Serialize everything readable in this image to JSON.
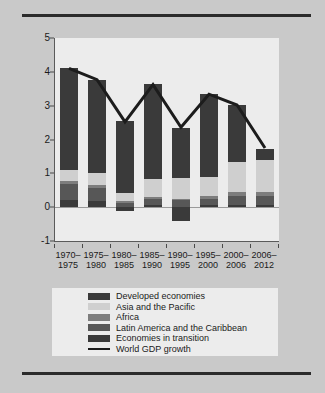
{
  "chart_data": {
    "type": "bar",
    "title": "",
    "subtitle": "",
    "xlabel": "",
    "ylabel": "",
    "stacked": true,
    "grid": false,
    "legend_position": "bottom",
    "ylim": [
      -1,
      5
    ],
    "yticks": [
      -1,
      0,
      1,
      2,
      3,
      4,
      5
    ],
    "ytick_labels": [
      "-1",
      "0",
      "1",
      "2",
      "3",
      "4",
      "5"
    ],
    "categories": [
      "1970–1975",
      "1975–1980",
      "1980–1985",
      "1985–1990",
      "1990–1995",
      "1995–2000",
      "2000–2006",
      "2006–2012"
    ],
    "category_lines": [
      [
        "1970–",
        "1975"
      ],
      [
        "1975–",
        "1980"
      ],
      [
        "1980–",
        "1985"
      ],
      [
        "1985–",
        "1990"
      ],
      [
        "1990–",
        "1995"
      ],
      [
        "1995–",
        "2000"
      ],
      [
        "2000–",
        "2006"
      ],
      [
        "2006–",
        "2012"
      ]
    ],
    "series": [
      {
        "name": "Economies in transition",
        "color": "#3a3a3a",
        "values": [
          0.22,
          0.18,
          -0.12,
          0.06,
          -0.42,
          0.05,
          0.06,
          0.05
        ]
      },
      {
        "name": "Latin America and the Caribbean",
        "color": "#575757",
        "values": [
          0.45,
          0.4,
          0.12,
          0.18,
          0.2,
          0.2,
          0.26,
          0.28
        ]
      },
      {
        "name": "Africa",
        "color": "#7d7d7d",
        "values": [
          0.11,
          0.08,
          0.06,
          0.06,
          0.05,
          0.07,
          0.12,
          0.12
        ]
      },
      {
        "name": "Asia and the Pacific",
        "color": "#cfcfcf",
        "values": [
          0.33,
          0.35,
          0.25,
          0.52,
          0.62,
          0.57,
          0.9,
          0.95
        ]
      },
      {
        "name": "Developed economies",
        "color": "#3a3a3a",
        "values": [
          2.99,
          2.76,
          2.12,
          2.81,
          1.47,
          2.45,
          1.67,
          0.32
        ]
      }
    ],
    "line_series": {
      "name": "World GDP growth",
      "color": "#1c1c1c",
      "values": [
        4.1,
        3.77,
        2.52,
        3.62,
        2.36,
        3.34,
        3.02,
        1.75
      ]
    }
  },
  "legend": {
    "entries": [
      {
        "label": "Developed economies",
        "swatch": "#3a3a3a",
        "type": "box"
      },
      {
        "label": "Asia and the Pacific",
        "swatch": "#cfcfcf",
        "type": "box"
      },
      {
        "label": "Africa",
        "swatch": "#7d7d7d",
        "type": "box"
      },
      {
        "label": "Latin America and the Caribbean",
        "swatch": "#575757",
        "type": "box"
      },
      {
        "label": "Economies in transition",
        "swatch": "#3a3a3a",
        "type": "box"
      },
      {
        "label": "World GDP growth",
        "swatch": "#1c1c1c",
        "type": "line"
      }
    ]
  },
  "colors": {
    "page_background": "#c9c9c9",
    "plot_background": "#ececec",
    "rule": "#2b2b2b",
    "axis": "#5a5a5a",
    "text": "#1a1a1a"
  }
}
